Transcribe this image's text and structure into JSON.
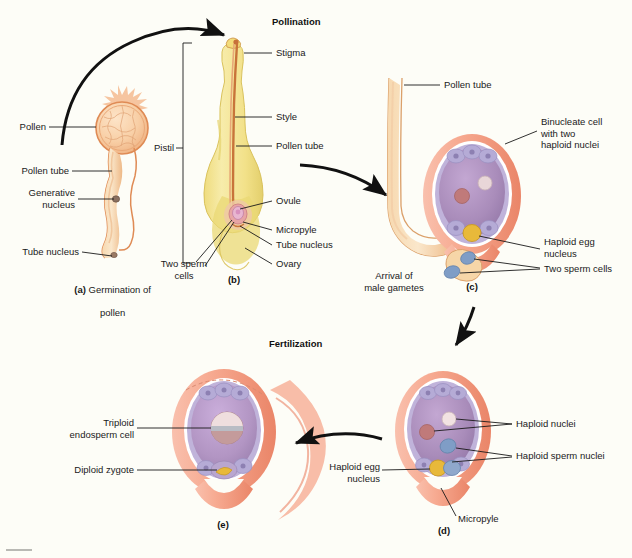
{
  "figure": {
    "background_color": "#fdfdf7"
  },
  "headings": [
    {
      "id": "pollination",
      "text": "Pollination"
    },
    {
      "id": "fertilization",
      "text": "Fertilization"
    }
  ],
  "panels": [
    {
      "id": "a",
      "marker": "(a)",
      "caption_bold": "(a)",
      "caption_rest": " Germination of",
      "caption_line2": "pollen"
    },
    {
      "id": "b",
      "marker": "(b)"
    },
    {
      "id": "c",
      "marker": "(c)"
    },
    {
      "id": "d",
      "marker": "(d)"
    },
    {
      "id": "e",
      "marker": "(e)"
    }
  ],
  "labels": {
    "a": [
      {
        "id": "pollen",
        "text": "Pollen"
      },
      {
        "id": "pollen-tube",
        "text": "Pollen tube"
      },
      {
        "id": "generative-nucleus",
        "text": "Generative\nnucleus"
      },
      {
        "id": "tube-nucleus",
        "text": "Tube nucleus"
      }
    ],
    "b": [
      {
        "id": "pistil",
        "text": "Pistil"
      },
      {
        "id": "stigma",
        "text": "Stigma"
      },
      {
        "id": "style",
        "text": "Style"
      },
      {
        "id": "pollen-tube",
        "text": "Pollen tube"
      },
      {
        "id": "ovule",
        "text": "Ovule"
      },
      {
        "id": "micropyle",
        "text": "Micropyle"
      },
      {
        "id": "tube-nucleus",
        "text": "Tube nucleus"
      },
      {
        "id": "ovary",
        "text": "Ovary"
      },
      {
        "id": "two-sperm-cells",
        "text": "Two sperm\ncells"
      }
    ],
    "c": [
      {
        "id": "pollen-tube",
        "text": "Pollen tube"
      },
      {
        "id": "binucleate-cell",
        "text": "Binucleate cell\nwith two\nhaploid nuclei"
      },
      {
        "id": "haploid-egg-nucleus",
        "text": "Haploid egg\nnucleus"
      },
      {
        "id": "two-sperm-cells",
        "text": "Two sperm cells"
      },
      {
        "id": "arrival-of-male-gametes",
        "text": "Arrival of\nmale gametes"
      }
    ],
    "d": [
      {
        "id": "haploid-nuclei",
        "text": "Haploid nuclei"
      },
      {
        "id": "haploid-sperm-nuclei",
        "text": "Haploid sperm nuclei"
      },
      {
        "id": "haploid-egg-nucleus",
        "text": "Haploid egg\nnucleus"
      },
      {
        "id": "micropyle",
        "text": "Micropyle"
      }
    ],
    "e": [
      {
        "id": "triploid-endosperm-cell",
        "text": "Triploid\nendosperm cell"
      },
      {
        "id": "diploid-zygote",
        "text": "Diploid zygote"
      }
    ]
  },
  "colors": {
    "background": "#fdfdf7",
    "pollen_fill": "#f8cfa6",
    "pollen_outline": "#df8b55",
    "pistil_fill": "#f4e58e",
    "pistil_shade": "#e8d468",
    "pollen_tube_fill": "#f3c38c",
    "pollen_tube_line": "#c8743a",
    "integument": "#f4a48c",
    "integument_dark": "#e8846a",
    "embryo_sac": "#a98cba",
    "embryo_sac_light": "#c4a9d0",
    "cell_layer": "#b9b2d8",
    "egg_yellow": "#e8b93a",
    "sperm_blue": "#7f9dc6",
    "nucleus_pink": "#c07a7a",
    "nucleus_white": "#f3e0e0",
    "endosperm_gray": "#b9bcc4",
    "leader_line": "#1a1a1a",
    "arrow": "#111111",
    "text": "#1a1a1a"
  }
}
